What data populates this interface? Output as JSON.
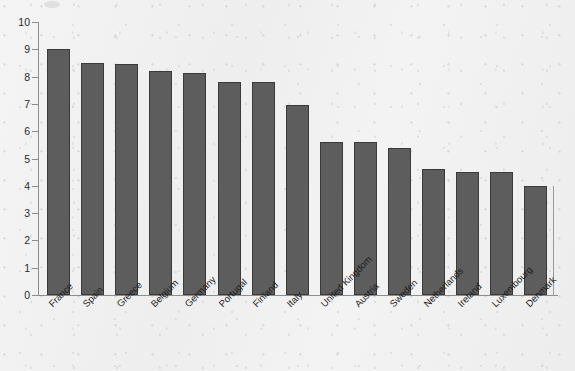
{
  "chart_data": {
    "type": "bar",
    "title": "",
    "subtitle": "",
    "xlabel": "",
    "ylabel": "",
    "categories": [
      "France",
      "Spain",
      "Greece",
      "Belgium",
      "Germany",
      "Portugal",
      "Finland",
      "Italy",
      "United Kingdom",
      "Austria",
      "Sweden",
      "Netherlands",
      "Ireland",
      "Luxembourg",
      "Denmark"
    ],
    "values": [
      9.0,
      8.5,
      8.45,
      8.2,
      8.15,
      7.8,
      7.8,
      6.95,
      5.6,
      5.6,
      5.4,
      4.6,
      4.5,
      4.5,
      4.0
    ],
    "ylim": [
      0,
      10
    ],
    "ytick_labels": [
      "0",
      "1",
      "2",
      "3",
      "4",
      "5",
      "6",
      "7",
      "8",
      "9",
      "10"
    ],
    "ytick_values": [
      0,
      1,
      2,
      3,
      4,
      5,
      6,
      7,
      8,
      9,
      10
    ],
    "grid": false,
    "legend": "none",
    "series_name": "",
    "bar_color": "#5d5d5d",
    "bar_edge_color": "#3a3a3a",
    "axis_color": "#8d8d8d",
    "background_color": "#f1f1f1",
    "text_color": "#1f1f1f",
    "label_rotation_degrees": -45
  }
}
